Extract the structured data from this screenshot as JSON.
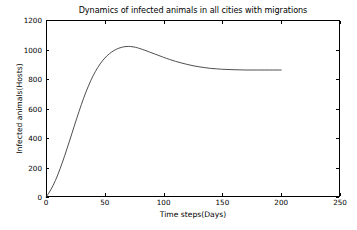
{
  "chart_data": {
    "type": "line",
    "title": "Dynamics of infected animals in all cities with migrations",
    "xlabel": "Time steps(Days)",
    "ylabel": "Infected animals(Hosts)",
    "xlim": [
      0,
      250
    ],
    "ylim": [
      0,
      1200
    ],
    "xticks": [
      0,
      50,
      100,
      150,
      200,
      250
    ],
    "xtick_labels": [
      "0",
      "50",
      "100",
      "150",
      "200",
      "250"
    ],
    "yticks": [
      0,
      200,
      400,
      600,
      800,
      1000,
      1200
    ],
    "ytick_labels": [
      "0",
      "200",
      "400",
      "600",
      "800",
      "1000",
      "1200"
    ],
    "grid": false,
    "legend": null,
    "line_color": "#3a3a3a",
    "line_width": 0.9,
    "background_color": "#ffffff",
    "frame_color": "#000000",
    "series": [
      {
        "name": "Infected animals (all cities, with migrations)",
        "x": [
          0,
          2,
          4,
          6,
          8,
          10,
          12,
          14,
          16,
          18,
          20,
          22,
          24,
          26,
          28,
          30,
          32,
          34,
          36,
          38,
          40,
          42,
          44,
          46,
          48,
          50,
          52,
          54,
          56,
          58,
          60,
          62,
          64,
          66,
          68,
          70,
          72,
          74,
          76,
          78,
          80,
          84,
          88,
          92,
          96,
          100,
          105,
          110,
          115,
          120,
          125,
          130,
          135,
          140,
          145,
          150,
          160,
          170,
          180,
          190,
          200
        ],
        "y": [
          0,
          22,
          48,
          78,
          112,
          150,
          192,
          236,
          283,
          331,
          380,
          430,
          480,
          530,
          578,
          625,
          670,
          712,
          751,
          788,
          821,
          851,
          878,
          902,
          923,
          942,
          958,
          972,
          984,
          994,
          1002,
          1009,
          1014,
          1018,
          1020,
          1021,
          1020,
          1018,
          1015,
          1011,
          1006,
          995,
          983,
          971,
          959,
          947,
          933,
          920,
          909,
          899,
          890,
          883,
          877,
          872,
          869,
          866,
          863,
          861,
          861,
          861,
          861
        ]
      }
    ],
    "annotations": {
      "peak_value": 1021,
      "peak_time": 70,
      "plateau_value": 861,
      "start_value": 0,
      "data_end_time": 200
    }
  }
}
